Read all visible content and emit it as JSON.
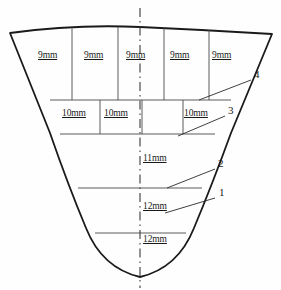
{
  "diagram": {
    "type": "engineering-cross-section",
    "background_color": "#fefefe",
    "outline_color": "#1a1a1a",
    "grid_color": "#4a4a4a",
    "centerline_color": "#3a3a3a",
    "centerline_style": "dash-dot",
    "rows": [
      {
        "id": "row-upper",
        "thickness_label": "9mm",
        "cell_count": 5,
        "labels": [
          "9mm",
          "9mm",
          "9mm",
          "9mm",
          "9mm"
        ],
        "label_positions_x": [
          44,
          90,
          133,
          177,
          218
        ],
        "label_y": 56
      },
      {
        "id": "row-middle",
        "thickness_label": "10mm",
        "cell_count": 4,
        "labels": [
          "10mm",
          "10mm",
          "",
          "10mm"
        ],
        "label_positions_x": [
          68,
          110,
          0,
          190
        ],
        "label_y": 114
      },
      {
        "id": "row-lower-1",
        "thickness_label": "11mm",
        "label_x": 142,
        "label_y": 159
      },
      {
        "id": "row-lower-2",
        "thickness_label": "12mm",
        "label_x": 142,
        "label_y": 207
      },
      {
        "id": "row-lower-3",
        "thickness_label": "12mm",
        "label_x": 142,
        "label_y": 240
      }
    ],
    "callouts": [
      {
        "id": "callout-4",
        "label": "4",
        "text_x": 256,
        "text_y": 74,
        "line": {
          "x1": 199,
          "y1": 100,
          "x2": 251,
          "y2": 80
        }
      },
      {
        "id": "callout-3",
        "label": "3",
        "text_x": 229,
        "text_y": 110,
        "line": {
          "x1": 178,
          "y1": 136,
          "x2": 225,
          "y2": 116
        }
      },
      {
        "id": "callout-2",
        "label": "2",
        "text_x": 219,
        "text_y": 163,
        "line": {
          "x1": 167,
          "y1": 188,
          "x2": 215,
          "y2": 169
        }
      },
      {
        "id": "callout-1",
        "label": "1",
        "text_x": 219,
        "text_y": 192,
        "line": {
          "x1": 165,
          "y1": 213,
          "x2": 215,
          "y2": 198
        }
      }
    ]
  }
}
